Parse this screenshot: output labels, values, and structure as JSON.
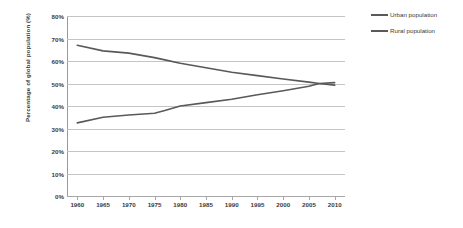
{
  "chart_data": {
    "type": "line",
    "title": "",
    "subtitle": "",
    "xlabel": "",
    "ylabel": "Percentage of global population (%)",
    "xlim": [
      1958,
      2012
    ],
    "ylim": [
      0,
      80
    ],
    "y_tick_step": 10,
    "grid": true,
    "legend_position": "right",
    "x_tick_labels": [
      "1960",
      "1965",
      "1970",
      "1975",
      "1980",
      "1985",
      "1990",
      "1995",
      "2000",
      "2005",
      "2010"
    ],
    "x_ticks": [
      1960,
      1965,
      1970,
      1975,
      1980,
      1985,
      1990,
      1995,
      2000,
      2005,
      2010
    ],
    "y_tick_labels": [
      "80%",
      "70%",
      "60%",
      "50%",
      "40%",
      "30%",
      "20%",
      "10%",
      "0%"
    ],
    "y_ticks": [
      80,
      70,
      60,
      50,
      40,
      30,
      20,
      10,
      0
    ],
    "x": [
      1960,
      1965,
      1970,
      1975,
      1977,
      1980,
      1985,
      1990,
      1995,
      2000,
      2005,
      2007,
      2010
    ],
    "series": [
      {
        "name": "Rural population",
        "color": "#595959",
        "values": [
          67.0,
          64.5,
          63.5,
          61.5,
          60.5,
          59.0,
          57.0,
          55.0,
          53.5,
          52.0,
          50.6,
          50.0,
          49.3
        ]
      },
      {
        "name": "Urban population",
        "color": "#595959",
        "values": [
          32.5,
          35.0,
          36.0,
          36.8,
          38.0,
          40.0,
          41.5,
          43.0,
          45.0,
          46.8,
          48.8,
          50.0,
          50.4
        ]
      }
    ],
    "annotations": []
  },
  "legend": {
    "items": [
      {
        "label": "Urban population",
        "color": "#595959"
      },
      {
        "label": "Rural population",
        "color": "#595959"
      }
    ]
  },
  "colors": {
    "line": "#595959",
    "gridline": "#c4c4c4",
    "axis": "#9a9a9a",
    "text": "#3a3a3a",
    "background": "#ffffff"
  }
}
